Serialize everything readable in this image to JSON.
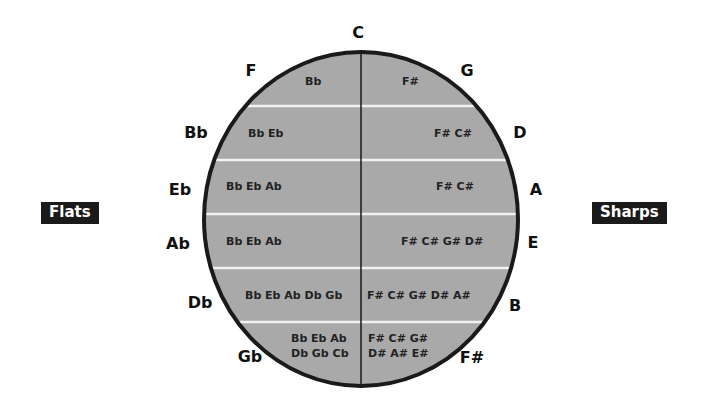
{
  "diagram": {
    "labels": {
      "flats": "Flats",
      "sharps": "Sharps"
    },
    "colors": {
      "circle_fill": "#a9a9a9",
      "circle_stroke": "#1a1a1a",
      "divider_lines": "#f2f2f2",
      "badge_bg": "#1a1a1a",
      "badge_text": "#ffffff"
    },
    "keys": {
      "top": "C",
      "sharp_side": [
        "G",
        "D",
        "A",
        "E",
        "B",
        "F#"
      ],
      "flat_side": [
        "F",
        "Bb",
        "Eb",
        "Ab",
        "Db",
        "Gb"
      ]
    },
    "rows": [
      {
        "flats": "Bb",
        "sharps": "F#"
      },
      {
        "flats": "Bb Eb",
        "sharps": "F# C#"
      },
      {
        "flats": "Bb Eb Ab",
        "sharps": "F# C#"
      },
      {
        "flats": "Bb Eb Ab",
        "sharps": "F# C# G# D#"
      },
      {
        "flats": "Bb Eb Ab Db Gb",
        "sharps": "F# C# G# D# A#"
      },
      {
        "flats_line1": "Bb Eb Ab",
        "flats_line2": "Db Gb Cb",
        "sharps_line1": "F# C# G#",
        "sharps_line2": "D# A# E#"
      }
    ]
  }
}
